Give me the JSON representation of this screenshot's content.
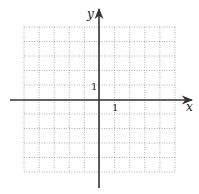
{
  "chart_data": {
    "type": "grid",
    "title": "",
    "xlabel": "x",
    "ylabel": "y",
    "xlim": [
      -5,
      5
    ],
    "ylim": [
      -5,
      5
    ],
    "grid": true,
    "grid_style": "dotted",
    "tick_labels": {
      "x": [
        {
          "value": 1,
          "label": "1"
        }
      ],
      "y": [
        {
          "value": 1,
          "label": "1"
        }
      ]
    },
    "series": []
  },
  "axes": {
    "x_label": "x",
    "y_label": "y",
    "x_tick_label": "1",
    "y_tick_label": "1"
  },
  "colors": {
    "axis": "#333333",
    "grid": "#9a9a9a",
    "background": "#ffffff"
  }
}
